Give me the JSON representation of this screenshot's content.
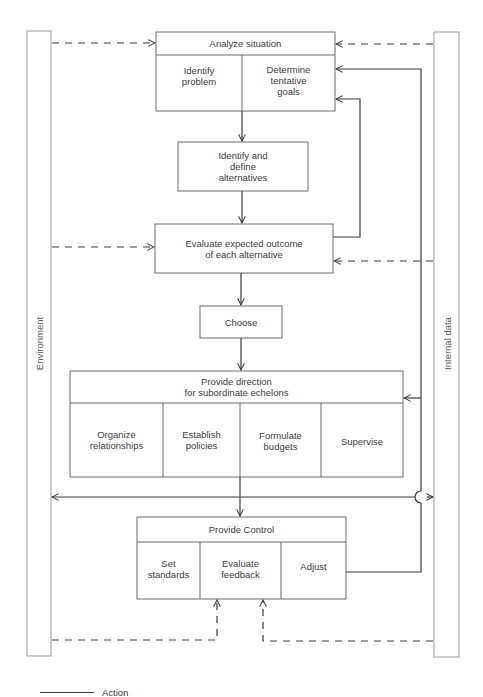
{
  "diagram": {
    "side_bars": {
      "left": {
        "label": "Environment"
      },
      "right": {
        "label": "Internal data"
      }
    },
    "analyze": {
      "title": "Analyze situation",
      "cells": [
        "Identify\nproblem",
        "Determine\ntentative\ngoals"
      ]
    },
    "alternatives": {
      "title": "Identify and\ndefine\nalternatives"
    },
    "evaluate": {
      "title": "Evaluate expected outcome\nof each alternative"
    },
    "choose": {
      "title": "Choose"
    },
    "direction": {
      "title": "Provide direction\nfor subordinate echelons",
      "cells": [
        "Organize\nrelationships",
        "Establish\npolicies",
        "Formulate\nbudgets",
        "Supervise"
      ]
    },
    "control": {
      "title": "Provide Control",
      "cells": [
        "Set\nstandards",
        "Evaluate\nfeedback",
        "Adjust"
      ]
    },
    "legend": {
      "solid_line_label": "Action"
    },
    "colors": {
      "box_stroke": "#6a6a6a",
      "action_line": "#3a3a3a",
      "dashed_line": "#3a3a3a",
      "bar_stroke": "#9a9a9a"
    }
  }
}
